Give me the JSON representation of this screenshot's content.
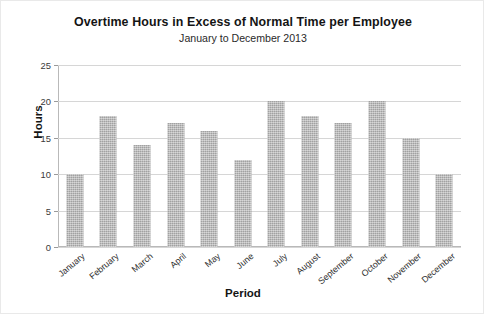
{
  "chart_data": {
    "type": "bar",
    "title": "Overtime Hours in Excess of Normal Time per Employee",
    "subtitle": "January to December 2013",
    "xlabel": "Period",
    "ylabel": "Hours",
    "categories": [
      "January",
      "February",
      "March",
      "April",
      "May",
      "June",
      "July",
      "August",
      "September",
      "October",
      "November",
      "December"
    ],
    "values": [
      10,
      18,
      14,
      17,
      16,
      12,
      20,
      18,
      17,
      20,
      15,
      10
    ],
    "yticks": [
      0,
      5,
      10,
      15,
      20,
      25
    ],
    "ylim": [
      0,
      25
    ],
    "grid": "horizontal",
    "legend": "none",
    "bar_color": "#b5b5b5"
  }
}
